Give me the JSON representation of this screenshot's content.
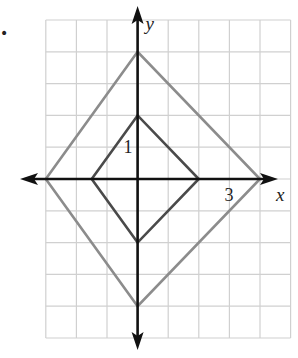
{
  "figure": {
    "marker": "•",
    "grid": {
      "x_min": -3,
      "x_max": 5,
      "y_min": -5,
      "y_max": 5,
      "origin_px": [
        137.6,
        179
      ],
      "unit_px": [
        30.6,
        31.8
      ],
      "color": "#d0d0d0"
    },
    "axes": {
      "x_label": "x",
      "y_label": "y",
      "color": "#111111",
      "tick_labels": [
        {
          "axis": "x",
          "value": 3,
          "text": "3"
        },
        {
          "axis": "y",
          "value": 1,
          "text": "1"
        }
      ]
    },
    "shapes": [
      {
        "name": "outer-rhombus",
        "color": "#8c8c8c",
        "vertices": [
          [
            -3,
            0
          ],
          [
            0,
            4
          ],
          [
            4,
            0
          ],
          [
            0,
            -4
          ]
        ]
      },
      {
        "name": "inner-rhombus",
        "color": "#4a4a4a",
        "vertices": [
          [
            -1.5,
            0
          ],
          [
            0,
            2
          ],
          [
            2,
            0
          ],
          [
            0,
            -2
          ]
        ]
      }
    ]
  }
}
